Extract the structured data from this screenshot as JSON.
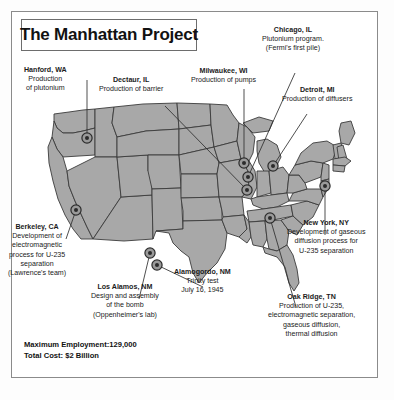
{
  "poster": {
    "title": "The Manhattan Project",
    "map_region": "United States"
  },
  "callouts": [
    {
      "id": "hanford",
      "city": "Hanford, WA",
      "lines": [
        "Production",
        "of plutonium"
      ]
    },
    {
      "id": "decatur",
      "city": "Dectaur, IL",
      "lines": [
        "Production of barrier"
      ]
    },
    {
      "id": "milwaukee",
      "city": "Milwaukee, WI",
      "lines": [
        "Production of pumps"
      ]
    },
    {
      "id": "chicago",
      "city": "Chicago, IL",
      "lines": [
        "Plutonium program.",
        "(Fermi's first pile)"
      ]
    },
    {
      "id": "detroit",
      "city": "Detroit, MI",
      "lines": [
        "Production of diffusers"
      ]
    },
    {
      "id": "berkeley",
      "city": "Berkeley, CA",
      "lines": [
        "Development of",
        "electromagnetic",
        "process for U-235",
        "separation",
        "(Lawrence's team)"
      ]
    },
    {
      "id": "losalamos",
      "city": "Los Alamos, NM",
      "lines": [
        "Design and assembly",
        "of the bomb",
        "(Oppenheimer's lab)"
      ]
    },
    {
      "id": "alamogordo",
      "city": "Alamogordo, NM",
      "lines": [
        "Trinity test",
        "July 16, 1945"
      ]
    },
    {
      "id": "newyork",
      "city": "New York, NY",
      "lines": [
        "Development of gaseous",
        "diffusion process for",
        "U-235 separation"
      ]
    },
    {
      "id": "oakridge",
      "city": "Oak Ridge, TN",
      "lines": [
        "Production of U-235,",
        "electromagnetic separation,",
        "gaseous diffusion,",
        "thermal diffusion"
      ]
    }
  ],
  "stats": {
    "employment": "Maximum Employment:129,000",
    "cost": "Total Cost: $2 Billion"
  },
  "colors": {
    "map_fill": "#a8a8a8",
    "map_stroke": "#3b3b3b",
    "frame": "#8b8b8b",
    "text": "#1b1b1b",
    "marker_ring": "#4a4a4a",
    "marker_core": "#2b2b2b"
  },
  "markers": [
    {
      "id": "hanford",
      "x": 76,
      "y": 127
    },
    {
      "id": "berkeley",
      "x": 65,
      "y": 199
    },
    {
      "id": "losalamos",
      "x": 139,
      "y": 242
    },
    {
      "id": "alamogordo",
      "x": 146,
      "y": 254
    },
    {
      "id": "milwaukee",
      "x": 233,
      "y": 152
    },
    {
      "id": "decatur",
      "x": 236,
      "y": 179
    },
    {
      "id": "chicago",
      "x": 237,
      "y": 166
    },
    {
      "id": "detroit",
      "x": 262,
      "y": 155
    },
    {
      "id": "oakridge",
      "x": 259,
      "y": 207
    },
    {
      "id": "newyork",
      "x": 314,
      "y": 175
    }
  ]
}
